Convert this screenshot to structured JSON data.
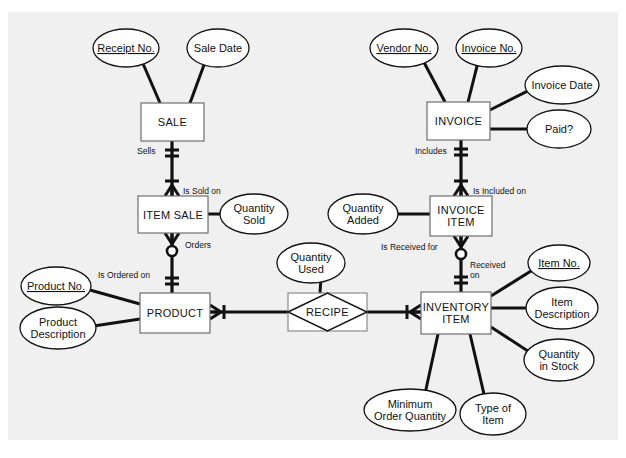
{
  "figure": {
    "name": "entity-relationship-diagram",
    "background_color": "#f0f0f0",
    "line_color": "#111111",
    "shape_fill": "#ffffff",
    "entity_stroke": "#6e6e6e"
  },
  "entities": [
    {
      "id": "sale",
      "label": "SALE",
      "line1": "SALE",
      "line2": "",
      "x": 141,
      "y": 103,
      "w": 63,
      "h": 38
    },
    {
      "id": "item-sale",
      "label": "ITEM SALE",
      "line1": "ITEM SALE",
      "line2": "",
      "x": 138,
      "y": 196,
      "w": 70,
      "h": 37
    },
    {
      "id": "product",
      "label": "PRODUCT",
      "line1": "PRODUCT",
      "line2": "",
      "x": 140,
      "y": 293,
      "w": 70,
      "h": 40
    },
    {
      "id": "invoice",
      "label": "INVOICE",
      "line1": "INVOICE",
      "line2": "",
      "x": 427,
      "y": 102,
      "w": 63,
      "h": 38
    },
    {
      "id": "invoice-item",
      "label": "INVOICE ITEM",
      "line1": "INVOICE",
      "line2": "ITEM",
      "x": 430,
      "y": 196,
      "w": 62,
      "h": 40
    },
    {
      "id": "inventory-item",
      "label": "INVENTORY ITEM",
      "line1": "INVENTORY",
      "line2": "ITEM",
      "x": 421,
      "y": 292,
      "w": 70,
      "h": 42
    }
  ],
  "associative_entity": {
    "id": "recipe",
    "label": "RECIPE",
    "x": 288,
    "y": 293,
    "w": 79,
    "h": 38
  },
  "attributes": [
    {
      "id": "receipt-no",
      "label": "Receipt No.",
      "line1": "Receipt No.",
      "line2": "",
      "pk": true,
      "cx": 126,
      "cy": 48,
      "rx": 33,
      "ry": 19,
      "link_to": [
        160,
        103
      ]
    },
    {
      "id": "sale-date",
      "label": "Sale Date",
      "line1": "Sale Date",
      "line2": "",
      "pk": false,
      "cx": 218,
      "cy": 48,
      "rx": 31,
      "ry": 19,
      "link_to": [
        190,
        103
      ]
    },
    {
      "id": "quantity-sold",
      "label": "Quantity Sold",
      "line1": "Quantity",
      "line2": "Sold",
      "pk": false,
      "cx": 254,
      "cy": 214,
      "rx": 34,
      "ry": 20,
      "link_to": [
        208,
        214
      ]
    },
    {
      "id": "product-no",
      "label": "Product No.",
      "line1": "Product No.",
      "line2": "",
      "pk": true,
      "cx": 56,
      "cy": 286,
      "rx": 35,
      "ry": 19,
      "link_to": [
        140,
        304
      ]
    },
    {
      "id": "product-desc",
      "label": "Product Description",
      "line1": "Product",
      "line2": "Description",
      "pk": false,
      "cx": 58,
      "cy": 328,
      "rx": 38,
      "ry": 21,
      "link_to": [
        140,
        319
      ]
    },
    {
      "id": "quantity-used",
      "label": "Quantity Used",
      "line1": "Quantity",
      "line2": "Used",
      "pk": false,
      "cx": 311,
      "cy": 263,
      "rx": 34,
      "ry": 20,
      "link_to": [
        320,
        293
      ]
    },
    {
      "id": "vendor-no",
      "label": "Vendor No.",
      "line1": "Vendor No.",
      "line2": "",
      "pk": true,
      "cx": 404,
      "cy": 48,
      "rx": 34,
      "ry": 19,
      "link_to": [
        445,
        102
      ]
    },
    {
      "id": "invoice-no",
      "label": "Invoice No.",
      "line1": "Invoice No.",
      "line2": "",
      "pk": true,
      "cx": 489,
      "cy": 48,
      "rx": 33,
      "ry": 19,
      "link_to": [
        468,
        102
      ]
    },
    {
      "id": "invoice-date",
      "label": "Invoice Date",
      "line1": "Invoice Date",
      "line2": "",
      "pk": false,
      "cx": 562,
      "cy": 85,
      "rx": 37,
      "ry": 19,
      "link_to": [
        490,
        110
      ]
    },
    {
      "id": "paid",
      "label": "Paid?",
      "line1": "Paid?",
      "line2": "",
      "pk": false,
      "cx": 559,
      "cy": 129,
      "rx": 32,
      "ry": 19,
      "link_to": [
        490,
        129
      ]
    },
    {
      "id": "quantity-added",
      "label": "Quantity Added",
      "line1": "Quantity",
      "line2": "Added",
      "pk": false,
      "cx": 363,
      "cy": 214,
      "rx": 35,
      "ry": 20,
      "link_to": [
        430,
        214
      ]
    },
    {
      "id": "item-no",
      "label": "Item No.",
      "line1": "Item No.",
      "line2": "",
      "pk": true,
      "cx": 559,
      "cy": 263,
      "rx": 31,
      "ry": 18,
      "link_to": [
        491,
        296
      ]
    },
    {
      "id": "item-description",
      "label": "Item Description",
      "line1": "Item",
      "line2": "Description",
      "pk": false,
      "cx": 562,
      "cy": 308,
      "rx": 36,
      "ry": 21,
      "link_to": [
        491,
        308
      ]
    },
    {
      "id": "quantity-in-stock",
      "label": "Quantity in Stock",
      "line1": "Quantity",
      "line2": "in Stock",
      "pk": false,
      "cx": 559,
      "cy": 360,
      "rx": 35,
      "ry": 21,
      "link_to": [
        491,
        327
      ]
    },
    {
      "id": "minimum-order-qty",
      "label": "Minimum Order Quantity",
      "line1": "Minimum",
      "line2": "Order Quantity",
      "pk": false,
      "cx": 410,
      "cy": 410,
      "rx": 46,
      "ry": 21,
      "link_to": [
        438,
        334
      ]
    },
    {
      "id": "type-of-item",
      "label": "Type of Item",
      "line1": "Type of",
      "line2": "Item",
      "pk": false,
      "cx": 493,
      "cy": 414,
      "rx": 33,
      "ry": 21,
      "link_to": [
        470,
        334
      ]
    }
  ],
  "relationships": [
    {
      "id": "sale-item-sale",
      "from": "sale",
      "to": "item-sale",
      "near_label": "Sells",
      "far_label": "Is Sold on",
      "near_label_pos": [
        137,
        154
      ],
      "far_label_pos": [
        183,
        194
      ],
      "path": [
        [
          172,
          141
        ],
        [
          172,
          196
        ]
      ],
      "near_notation": "one-and-only-one",
      "far_notation": "one-or-many"
    },
    {
      "id": "item-sale-product",
      "from": "item-sale",
      "to": "product",
      "near_label": "Orders",
      "far_label": "Is Ordered on",
      "near_label_pos": [
        185,
        248
      ],
      "far_label_pos": [
        98,
        278
      ],
      "path": [
        [
          172,
          233
        ],
        [
          172,
          293
        ]
      ],
      "near_notation": "zero-or-many",
      "far_notation": "one-and-only-one"
    },
    {
      "id": "product-recipe",
      "from": "product",
      "to": "recipe",
      "near_label": "",
      "far_label": "",
      "near_label_pos": [
        0,
        0
      ],
      "far_label_pos": [
        0,
        0
      ],
      "path": [
        [
          210,
          312
        ],
        [
          288,
          312
        ]
      ],
      "near_notation": "one-or-many-h",
      "far_notation": "none"
    },
    {
      "id": "recipe-inventory-item",
      "from": "recipe",
      "to": "inventory-item",
      "near_label": "",
      "far_label": "",
      "near_label_pos": [
        0,
        0
      ],
      "far_label_pos": [
        0,
        0
      ],
      "path": [
        [
          367,
          312
        ],
        [
          421,
          312
        ]
      ],
      "near_notation": "none",
      "far_notation": "one-or-many-h-left"
    },
    {
      "id": "invoice-invoice-item",
      "from": "invoice",
      "to": "invoice-item",
      "near_label": "Includes",
      "far_label": "Is Included on",
      "near_label_pos": [
        415,
        154
      ],
      "far_label_pos": [
        473,
        194
      ],
      "path": [
        [
          461,
          140
        ],
        [
          461,
          196
        ]
      ],
      "near_notation": "one-and-only-one",
      "far_notation": "one-or-many"
    },
    {
      "id": "invoice-item-inventory-item",
      "from": "invoice-item",
      "to": "inventory-item",
      "near_label": "Is Received for",
      "far_label": "Received on",
      "near_label_pos": [
        381,
        250
      ],
      "far_label_pos": [
        470,
        268
      ],
      "path": [
        [
          461,
          236
        ],
        [
          461,
          292
        ]
      ],
      "near_notation": "zero-or-many",
      "far_notation": "one-and-only-one"
    }
  ],
  "legend": {
    "notation": "Crow's Foot",
    "pk_style": "underline"
  }
}
